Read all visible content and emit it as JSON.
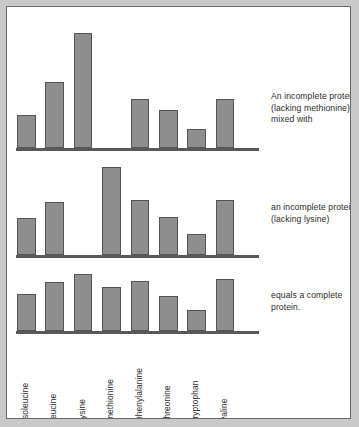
{
  "figure": {
    "title": "",
    "background": "#ffffff",
    "frame_color": "#6b6b6b",
    "outer_background": "#c9c9c9"
  },
  "captions": [
    {
      "id": "caption-1",
      "text": "An incomplete protein (lacking methionine) mixed with"
    },
    {
      "id": "caption-2",
      "text": "an incomplete protein (lacking lysine)"
    },
    {
      "id": "caption-3",
      "text": "equals a complete protein."
    }
  ],
  "axis": {
    "categories": [
      "isoleucine",
      "leucine",
      "lysine",
      "methionine",
      "phenylalanine",
      "threonine",
      "tryptophan",
      "valine"
    ]
  },
  "chart_data": [
    {
      "type": "bar",
      "title": "An incomplete protein (lacking methionine) mixed with",
      "xlabel": "",
      "ylabel": "",
      "grid": false,
      "legend": "none",
      "bar_color": "#8e8e8e",
      "bar_edge_color": "#545454",
      "categories": [
        "isoleucine",
        "leucine",
        "lysine",
        "methionine",
        "phenylalanine",
        "threonine",
        "tryptophan",
        "valine"
      ],
      "values": [
        32,
        63,
        110,
        0,
        47,
        36,
        18,
        47
      ],
      "ylim": [
        0,
        120
      ]
    },
    {
      "type": "bar",
      "title": "an incomplete protein (lacking lysine)",
      "xlabel": "",
      "ylabel": "",
      "grid": false,
      "legend": "none",
      "bar_color": "#8e8e8e",
      "bar_edge_color": "#545454",
      "categories": [
        "isoleucine",
        "leucine",
        "lysine",
        "methionine",
        "phenylalanine",
        "threonine",
        "tryptophan",
        "valine"
      ],
      "values": [
        35,
        50,
        0,
        83,
        52,
        36,
        20,
        52
      ],
      "ylim": [
        0,
        120
      ]
    },
    {
      "type": "bar",
      "title": "equals a complete protein.",
      "xlabel": "",
      "ylabel": "",
      "grid": false,
      "legend": "none",
      "bar_color": "#8e8e8e",
      "bar_edge_color": "#545454",
      "categories": [
        "isoleucine",
        "leucine",
        "lysine",
        "methionine",
        "phenylalanine",
        "threonine",
        "tryptophan",
        "valine"
      ],
      "values": [
        34,
        45,
        52,
        40,
        46,
        32,
        19,
        48
      ],
      "ylim": [
        0,
        120
      ]
    }
  ]
}
